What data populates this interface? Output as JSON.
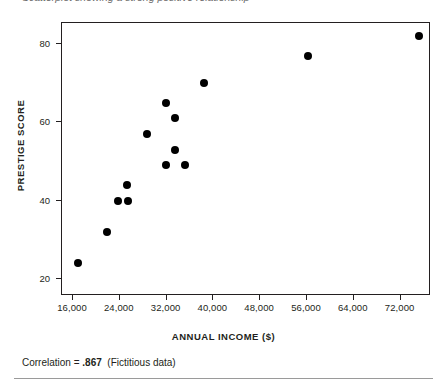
{
  "header": {
    "cropped_text": "Scatterplot showing a strong positive relationship"
  },
  "figure": {
    "caption_prefix": "Correlation = ",
    "caption_value": ".867",
    "caption_note": "(Fictitious data)"
  },
  "chart_data": {
    "type": "scatter",
    "title": "",
    "xlabel": "ANNUAL INCOME ($)",
    "ylabel": "PRESTIGE SCORE",
    "xlim": [
      14000,
      77000
    ],
    "ylim": [
      16.0,
      85.0
    ],
    "grid": false,
    "legend": null,
    "xticks": [
      16000,
      24000,
      32000,
      40000,
      48000,
      56000,
      64000,
      72000
    ],
    "xtick_labels": [
      "16,000",
      "24,000",
      "32,000",
      "40,000",
      "48,000",
      "56,000",
      "64,000",
      "72,000"
    ],
    "yticks": [
      20,
      40,
      60,
      80
    ],
    "ytick_labels": [
      "20",
      "40",
      "60",
      "80"
    ],
    "marker": {
      "shape": "circle",
      "color": "#000000",
      "size": 8
    },
    "correlation": 0.867,
    "n_points": 14,
    "points": [
      {
        "x": 16900,
        "y": 24
      },
      {
        "x": 21800,
        "y": 32
      },
      {
        "x": 23700,
        "y": 40
      },
      {
        "x": 25400,
        "y": 40
      },
      {
        "x": 25200,
        "y": 44
      },
      {
        "x": 28600,
        "y": 57
      },
      {
        "x": 31900,
        "y": 65
      },
      {
        "x": 31900,
        "y": 49
      },
      {
        "x": 33400,
        "y": 61
      },
      {
        "x": 33400,
        "y": 53
      },
      {
        "x": 35100,
        "y": 49
      },
      {
        "x": 38400,
        "y": 70
      },
      {
        "x": 56200,
        "y": 77
      },
      {
        "x": 75100,
        "y": 82
      }
    ]
  }
}
